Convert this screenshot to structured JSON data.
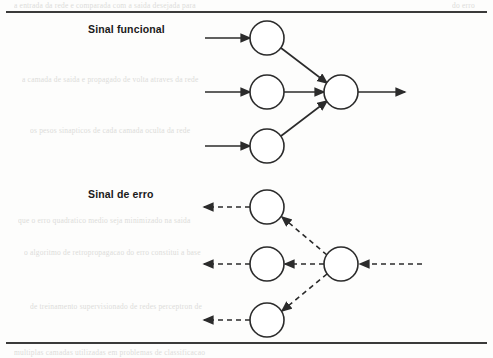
{
  "figure": {
    "labels": {
      "forward": "Sinal funcional",
      "error": "Sinal de erro"
    },
    "rules": {
      "top": "horizontal-rule-top",
      "bottom": "horizontal-rule-bottom"
    },
    "bleed_text": [
      "a entrada da rede e comparada com a saida desejada para",
      "do erro",
      "a camada de saida e propagado de volta atraves da rede",
      "os pesos sinapticos de cada camada oculta da rede",
      "que o erro quadratico medio seja minimizado na saida",
      "o algoritmo de retropropagacao do erro constitui a base",
      "de treinamento supervisionado de redes perceptron de",
      "multiplas camadas utilizadas em problemas de classificacao"
    ]
  },
  "chart_data": {
    "type": "diagram",
    "stroke_color": "#2b2b2b",
    "node_fill": "#ffffff",
    "node_radius": 17,
    "stroke_width": 1.6,
    "panels": [
      {
        "name": "forward-signal",
        "label": "Sinal funcional",
        "direction": "left-to-right",
        "line_style": "solid",
        "nodes": [
          {
            "id": "f-in-1",
            "cx": 267,
            "cy": 38,
            "role": "hidden-node"
          },
          {
            "id": "f-in-2",
            "cx": 267,
            "cy": 92,
            "role": "hidden-node"
          },
          {
            "id": "f-in-3",
            "cx": 267,
            "cy": 146,
            "role": "hidden-node"
          },
          {
            "id": "f-hub",
            "cx": 341,
            "cy": 92,
            "role": "output-node"
          }
        ],
        "edges": [
          {
            "from": "external",
            "to": "f-in-1",
            "x1": 205,
            "y1": 38,
            "x2": 250,
            "y2": 38
          },
          {
            "from": "external",
            "to": "f-in-2",
            "x1": 205,
            "y1": 92,
            "x2": 250,
            "y2": 92
          },
          {
            "from": "external",
            "to": "f-in-3",
            "x1": 205,
            "y1": 146,
            "x2": 250,
            "y2": 146
          },
          {
            "from": "f-in-1",
            "to": "f-hub",
            "x1": 281,
            "y1": 48,
            "x2": 327,
            "y2": 83
          },
          {
            "from": "f-in-2",
            "to": "f-hub",
            "x1": 284,
            "y1": 92,
            "x2": 324,
            "y2": 92
          },
          {
            "from": "f-in-3",
            "to": "f-hub",
            "x1": 281,
            "y1": 136,
            "x2": 327,
            "y2": 101
          },
          {
            "from": "f-hub",
            "to": "external",
            "x1": 358,
            "y1": 92,
            "x2": 405,
            "y2": 92
          }
        ]
      },
      {
        "name": "error-signal",
        "label": "Sinal de erro",
        "direction": "right-to-left",
        "line_style": "dashed",
        "dash_pattern": "5,4",
        "nodes": [
          {
            "id": "e-out-1",
            "cx": 267,
            "cy": 207,
            "role": "hidden-node"
          },
          {
            "id": "e-out-2",
            "cx": 267,
            "cy": 264,
            "role": "hidden-node"
          },
          {
            "id": "e-out-3",
            "cx": 267,
            "cy": 320,
            "role": "hidden-node"
          },
          {
            "id": "e-hub",
            "cx": 341,
            "cy": 264,
            "role": "output-node"
          }
        ],
        "edges": [
          {
            "from": "external",
            "to": "e-hub",
            "x1": 422,
            "y1": 264,
            "x2": 360,
            "y2": 264
          },
          {
            "from": "e-hub",
            "to": "e-out-1",
            "x1": 327,
            "y1": 255,
            "x2": 282,
            "y2": 217
          },
          {
            "from": "e-hub",
            "to": "e-out-2",
            "x1": 324,
            "y1": 264,
            "x2": 285,
            "y2": 264
          },
          {
            "from": "e-hub",
            "to": "e-out-3",
            "x1": 327,
            "y1": 274,
            "x2": 282,
            "y2": 311
          },
          {
            "from": "e-out-1",
            "to": "external",
            "x1": 250,
            "y1": 207,
            "x2": 204,
            "y2": 207
          },
          {
            "from": "e-out-2",
            "to": "external",
            "x1": 250,
            "y1": 264,
            "x2": 204,
            "y2": 264
          },
          {
            "from": "e-out-3",
            "to": "external",
            "x1": 250,
            "y1": 320,
            "x2": 204,
            "y2": 320
          }
        ]
      }
    ]
  }
}
